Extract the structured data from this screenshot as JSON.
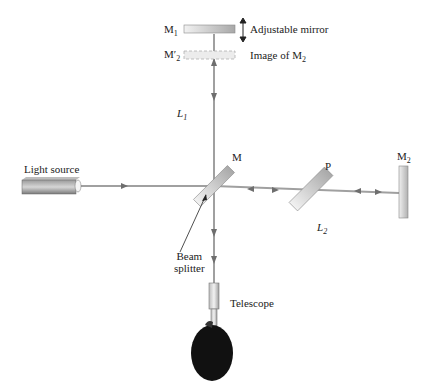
{
  "diagram": {
    "type": "Michelson interferometer",
    "labels": {
      "m1": "M",
      "m1_sub": "1",
      "adjustable_mirror": "Adjustable mirror",
      "m2_prime": "M",
      "m2_prime_sub": "2",
      "m2_prime_mark": "′",
      "image_of_m2": "Image of M",
      "image_of_m2_sub": "2",
      "l1": "L",
      "l1_sub": "1",
      "light_source": "Light source",
      "m": "M",
      "p": "P",
      "m2": "M",
      "m2_sub": "2",
      "l2": "L",
      "l2_sub": "2",
      "beam_splitter_line1": "Beam",
      "beam_splitter_line2": "splitter",
      "telescope": "Telescope"
    },
    "colors": {
      "beam": "#9a9a9a",
      "arrow": "#6e6e6e",
      "mirror_fill": "#cfcfcf",
      "head": "#111111"
    }
  }
}
